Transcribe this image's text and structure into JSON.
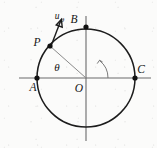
{
  "figure": {
    "type": "geometry-diagram",
    "background_color": "#fbfbfa",
    "stroke_color": "#1c1c1c",
    "axis_color": "#6b6b6b",
    "radius_color": "#8a8a8a",
    "canvas": {
      "width": 157,
      "height": 148
    },
    "circle": {
      "cx": 86,
      "cy": 78,
      "r": 49
    },
    "axes": {
      "horizontal": {
        "x1": 19,
        "y1": 78,
        "x2": 151,
        "y2": 78
      },
      "vertical": {
        "x1": 86,
        "y1": 16,
        "x2": 86,
        "y2": 141
      }
    },
    "points": [
      {
        "name": "A",
        "label": "A",
        "x": 37,
        "y": 78,
        "label_x": 33,
        "label_y": 91
      },
      {
        "name": "B",
        "label": "B",
        "x": 86,
        "y": 27,
        "label_x": 74,
        "label_y": 23
      },
      {
        "name": "C",
        "label": "C",
        "x": 135,
        "y": 78,
        "label_x": 139,
        "label_y": 73
      },
      {
        "name": "P",
        "label": "P",
        "x": 50,
        "y": 46,
        "label_x": 37,
        "label_y": 45
      },
      {
        "name": "O",
        "label": "O",
        "x": 86,
        "y": 78,
        "label_x": 78,
        "label_y": 91
      }
    ],
    "radius_segment": {
      "from": "O",
      "to": "P",
      "x1": 86,
      "y1": 78,
      "x2": 50,
      "y2": 46
    },
    "angle": {
      "symbol": "θ",
      "label": "θ",
      "label_x": 55,
      "label_y": 70,
      "vertex": "O",
      "from_axis": "positive-x",
      "to_segment": "OP",
      "arc_radius": 22
    },
    "vector": {
      "name": "u-theta",
      "base_label": "u",
      "subscript_label": "θ",
      "label_x": 58,
      "label_y": 19,
      "tail_x": 51,
      "tail_y": 46,
      "tip_x": 61,
      "tip_y": 20,
      "direction": "tangent, counterclockwise"
    }
  }
}
